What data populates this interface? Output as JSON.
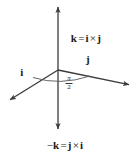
{
  "figure": {
    "background_color": "#ffffff",
    "stroke_color": "#3a3a3a",
    "text_color": "#1a1a1a",
    "width": 140,
    "height": 162
  },
  "labels": {
    "top": {
      "vector": "k",
      "equals": "=",
      "left_factor": "i",
      "operator": "×",
      "right_factor": "j",
      "full_text": "k = i × j",
      "x": 86,
      "y": 38
    },
    "bottom": {
      "sign": "−",
      "vector": "k",
      "equals": "=",
      "left_factor": "j",
      "operator": "×",
      "right_factor": "i",
      "full_text": "−k = j × i",
      "x": 65,
      "y": 145
    },
    "i_axis": {
      "text": "i",
      "x": 22,
      "y": 72
    },
    "j_axis": {
      "text": "j",
      "x": 88,
      "y": 59
    },
    "angle": {
      "numerator": "π",
      "denominator": "2",
      "full_text": "π/2",
      "x": 69,
      "y": 75
    }
  },
  "axes": [
    {
      "name": "k-axis-up",
      "from": [
        58,
        70
      ],
      "to": [
        58,
        6
      ],
      "arrow": true
    },
    {
      "name": "k-axis-down",
      "from": [
        58,
        70
      ],
      "to": [
        58,
        130
      ],
      "arrow": true
    },
    {
      "name": "j-axis",
      "from": [
        58,
        70
      ],
      "to": [
        131,
        85
      ],
      "arrow": true
    },
    {
      "name": "i-axis",
      "from": [
        58,
        70
      ],
      "to": [
        8,
        101
      ],
      "arrow": true
    }
  ],
  "angle_arc": {
    "name": "right-angle-arc",
    "description": "elliptical arc from i-axis to j-axis indicating pi/2"
  }
}
